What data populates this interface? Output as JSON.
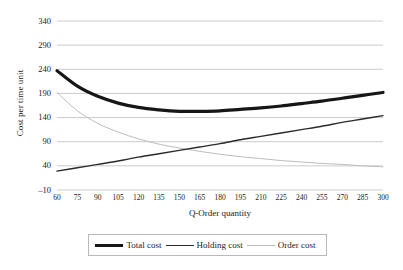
{
  "chart_data": {
    "type": "line",
    "title": "",
    "xlabel": "Q-Order quantity",
    "ylabel": "Cost per time unit",
    "xlim": [
      60,
      300
    ],
    "ylim": [
      -10,
      340
    ],
    "yticks": [
      340,
      290,
      240,
      190,
      140,
      90,
      40,
      -10
    ],
    "xticks": [
      60,
      75,
      90,
      105,
      120,
      135,
      150,
      165,
      180,
      195,
      210,
      225,
      240,
      255,
      270,
      285,
      300
    ],
    "grid": "horizontal",
    "legend_position": "bottom",
    "x": [
      60,
      75,
      90,
      105,
      120,
      135,
      150,
      165,
      180,
      195,
      210,
      225,
      240,
      255,
      270,
      285,
      300
    ],
    "series": [
      {
        "name": "Total cost",
        "color": "#161616",
        "width": 3.2,
        "values": [
          237,
          205,
          184,
          170,
          161,
          156,
          153,
          153,
          154,
          157,
          160,
          164,
          169,
          174,
          180,
          186,
          192
        ]
      },
      {
        "name": "Holding cost",
        "color": "#2a2a2a",
        "width": 1.4,
        "values": [
          29,
          36,
          43,
          50,
          58,
          65,
          72,
          79,
          86,
          94,
          101,
          108,
          115,
          122,
          130,
          137,
          144
        ]
      },
      {
        "name": "Order cost",
        "color": "#bdbdbd",
        "width": 1.0,
        "values": [
          192,
          154,
          128,
          110,
          96,
          85,
          77,
          70,
          64,
          59,
          55,
          51,
          48,
          45,
          43,
          40,
          38
        ]
      }
    ]
  },
  "axes": {
    "y_title": "Cost per time unit",
    "x_title": "Q-Order quantity",
    "y_tick_labels": [
      "340",
      "290",
      "240",
      "190",
      "140",
      "90",
      "40",
      "–10"
    ],
    "x_tick_labels": [
      "60",
      "75",
      "90",
      "105",
      "120",
      "135",
      "150",
      "165",
      "180",
      "195",
      "210",
      "225",
      "240",
      "255",
      "270",
      "285",
      "300"
    ]
  },
  "legend": {
    "items": [
      {
        "label": "Total cost"
      },
      {
        "label": "Holding cost"
      },
      {
        "label": "Order cost"
      }
    ]
  },
  "style": {
    "background": "#ffffff",
    "gridline_color": "#c6c6c6",
    "total_cost_color": "#161616",
    "holding_cost_color": "#2a2a2a",
    "order_cost_color": "#bdbdbd"
  }
}
